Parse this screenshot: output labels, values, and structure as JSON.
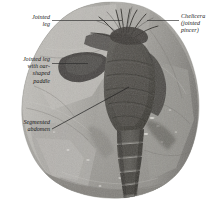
{
  "figure": {
    "background_color": "#ffffff",
    "label_color": "#1a1a1a",
    "leader_color": "#2b2b2b",
    "rock_light": "#b9b7b2",
    "rock_mid": "#9b9893",
    "rock_dark": "#6f6d69",
    "fossil_dark": "#4a4843",
    "fossil_darkest": "#33312e",
    "highlight": "#e8e6e1"
  },
  "labels": [
    {
      "id": "jointed-leg",
      "text": "Jointed\nleg",
      "align": "right"
    },
    {
      "id": "paddle-leg",
      "text": "Jointed leg\nwith oar-\nshaped\npaddle",
      "align": "right"
    },
    {
      "id": "abdomen",
      "text": "Segmented\nabdomen",
      "align": "right"
    },
    {
      "id": "chelicera",
      "text": "Chelicera\n(jointed\npincer)",
      "align": "left"
    }
  ],
  "leaders": [
    {
      "id": "leader-jointed-leg",
      "x1": 52,
      "y1": 20,
      "x2": 122,
      "y2": 20
    },
    {
      "id": "leader-paddle-leg",
      "x1": 52,
      "y1": 63,
      "x2": 88,
      "y2": 63
    },
    {
      "id": "leader-abdomen",
      "x1": 52,
      "y1": 129,
      "x2": 128,
      "y2": 88
    },
    {
      "id": "leader-chelicera",
      "x1": 147,
      "y1": 20,
      "x2": 179,
      "y2": 20
    }
  ]
}
